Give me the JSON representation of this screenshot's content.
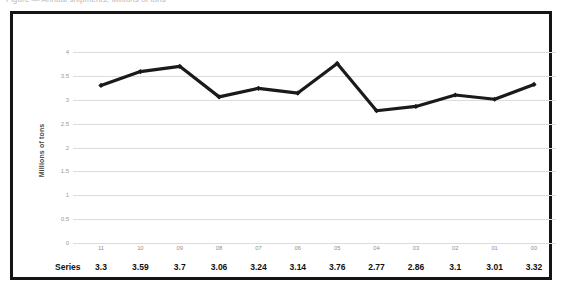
{
  "caption": {
    "text": "Figure — Annual shipments, Millions of tons"
  },
  "chart_data": {
    "type": "line",
    "title": "",
    "xlabel": "",
    "ylabel": "Millions of tons",
    "categories": [
      "11",
      "10",
      "09",
      "08",
      "07",
      "06",
      "05",
      "04",
      "03",
      "02",
      "01",
      "00"
    ],
    "values": [
      3.3,
      3.59,
      3.7,
      3.06,
      3.24,
      3.14,
      3.76,
      2.77,
      2.86,
      3.1,
      3.01,
      3.32
    ],
    "series": [
      {
        "name": "Series",
        "values": [
          3.3,
          3.59,
          3.7,
          3.06,
          3.24,
          3.14,
          3.76,
          2.77,
          2.86,
          3.1,
          3.01,
          3.32
        ],
        "color": "#1a1a1a"
      }
    ],
    "ylim": [
      0,
      4
    ],
    "yticks": [
      0,
      0.5,
      1,
      1.5,
      2,
      2.5,
      3,
      3.5,
      4
    ],
    "ytick_labels": [
      "0",
      "0.5",
      "1",
      "1.5",
      "2",
      "2.5",
      "3",
      "3.5",
      "4"
    ],
    "grid": true,
    "legend": false,
    "legend_position": "none",
    "marker": "diamond",
    "line_color": "#1a1a1a",
    "grid_color": "#dcdcdc"
  },
  "data_table": {
    "row_header": "Series",
    "values": [
      "3.3",
      "3.59",
      "3.7",
      "3.06",
      "3.24",
      "3.14",
      "3.76",
      "2.77",
      "2.86",
      "3.1",
      "3.01",
      "3.32"
    ]
  },
  "colors": {
    "frame": "#151515",
    "line": "#1a1a1a",
    "grid": "#dcdcdc",
    "axis_text": "#9a9a9a",
    "table_text": "#101010"
  }
}
